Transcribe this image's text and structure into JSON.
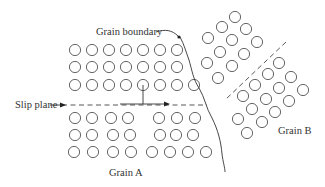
{
  "figure": {
    "width": 325,
    "height": 187,
    "colors": {
      "stroke": "#333333",
      "atom": "#555555",
      "background": "#ffffff"
    }
  },
  "labels": {
    "grain_boundary": {
      "text": "Grain boundary",
      "x": 96,
      "y": 35
    },
    "slip_plane": {
      "text": "Slip plane",
      "x": 15,
      "y": 110
    },
    "grain_a": {
      "text": "Grain A",
      "x": 109,
      "y": 176
    },
    "grain_b": {
      "text": "Grain B",
      "x": 278,
      "y": 133
    }
  },
  "atom_radius": 5.6,
  "grain_a": {
    "upper_rows": [
      [
        [
          75,
          50
        ],
        [
          92,
          50
        ],
        [
          109,
          50
        ],
        [
          126,
          50
        ],
        [
          143,
          50
        ],
        [
          160,
          50
        ],
        [
          177,
          50
        ]
      ],
      [
        [
          75,
          67
        ],
        [
          92,
          67
        ],
        [
          109,
          67
        ],
        [
          126,
          67
        ],
        [
          143,
          67
        ],
        [
          160,
          67
        ],
        [
          177,
          67
        ]
      ],
      [
        [
          75,
          85
        ],
        [
          92,
          85
        ],
        [
          109,
          85
        ],
        [
          126,
          85
        ],
        [
          143,
          85
        ],
        [
          160,
          85
        ],
        [
          177,
          85
        ],
        [
          194,
          85
        ]
      ]
    ],
    "lower_rows": [
      [
        [
          75,
          118
        ],
        [
          92,
          118
        ],
        [
          111,
          118
        ],
        [
          128,
          118
        ],
        [
          159,
          118
        ],
        [
          177,
          118
        ],
        [
          195,
          118
        ]
      ],
      [
        [
          75,
          135
        ],
        [
          92,
          135
        ],
        [
          113,
          135
        ],
        [
          130,
          135
        ],
        [
          160,
          135
        ],
        [
          176,
          135
        ],
        [
          193,
          135
        ]
      ],
      [
        [
          74,
          152
        ],
        [
          93,
          152
        ],
        [
          113,
          152
        ],
        [
          131,
          152
        ],
        [
          152,
          152
        ],
        [
          170,
          152
        ],
        [
          188,
          152
        ],
        [
          206,
          152
        ]
      ]
    ]
  },
  "grain_b": {
    "upper_block": [
      [
        235,
        17
      ],
      [
        222,
        27
      ],
      [
        246,
        29
      ],
      [
        208,
        38
      ],
      [
        232,
        40
      ],
      [
        257,
        42
      ],
      [
        220,
        52
      ],
      [
        244,
        54
      ],
      [
        207,
        63
      ],
      [
        232,
        66
      ],
      [
        218,
        78
      ]
    ],
    "lower_block": [
      [
        279,
        63
      ],
      [
        268,
        74
      ],
      [
        291,
        77
      ],
      [
        255,
        85
      ],
      [
        279,
        88
      ],
      [
        303,
        90
      ],
      [
        243,
        96
      ],
      [
        266,
        99
      ],
      [
        289,
        101
      ],
      [
        252,
        109
      ],
      [
        275,
        112
      ],
      [
        238,
        119
      ],
      [
        262,
        122
      ],
      [
        247,
        133
      ]
    ]
  },
  "slip_plane_line": {
    "x1": 62,
    "y1": 105,
    "x2": 207,
    "y2": 105
  },
  "dislocation": {
    "half_plane": {
      "x1": 143,
      "y1": 85,
      "x2": 143,
      "y2": 104
    },
    "glide_bar": {
      "x1": 120,
      "y1": 104,
      "x2": 165,
      "y2": 104
    },
    "arrow_tip": {
      "x": 170,
      "y": 102
    }
  },
  "grain_b_slip_line": {
    "x1": 286,
    "y1": 42,
    "x2": 225,
    "y2": 100
  },
  "grain_boundary_path": "M180,37 C184,44 186,52 189,60 C192,70 193,79 199,88 C205,98 206,108 212,118 C218,130 221,142 222,154 C223,162 225,168 225,172",
  "leader": {
    "path": "M156,32 C165,29 172,30 178,36"
  }
}
